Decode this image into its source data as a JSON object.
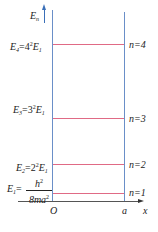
{
  "diagram": {
    "y_axis_label": "E",
    "y_axis_sub": "n",
    "x_axis_label": "x",
    "origin_label": "O",
    "wall_label": "a",
    "levels": [
      {
        "n_label": "n=4",
        "energy_prefix": "E",
        "energy_sub": "4",
        "energy_eq": "=4",
        "energy_pow": "2",
        "energy_tail": "E",
        "energy_tail_sub": "1"
      },
      {
        "n_label": "n=3",
        "energy_prefix": "E",
        "energy_sub": "3",
        "energy_eq": "=3",
        "energy_pow": "2",
        "energy_tail": "E",
        "energy_tail_sub": "1"
      },
      {
        "n_label": "n=2",
        "energy_prefix": "E",
        "energy_sub": "2",
        "energy_eq": "=2",
        "energy_pow": "2",
        "energy_tail": "E",
        "energy_tail_sub": "1"
      },
      {
        "n_label": "n=1",
        "energy_prefix": "E",
        "energy_sub": "1",
        "energy_eq": "=",
        "frac_num": "h",
        "frac_num_pow": "2",
        "frac_den": "8ma",
        "frac_den_pow": "2"
      }
    ],
    "colors": {
      "axis": "#6a8fc8",
      "level": "#e06a85",
      "x_axis": "#555555"
    }
  }
}
